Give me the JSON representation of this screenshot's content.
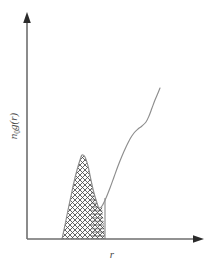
{
  "figure": {
    "kind": "scientific-line-plot",
    "background_color": "#ffffff",
    "axis_color": "#6e6e6e",
    "curve_color": "#8d8d8d",
    "hatch_color": "#4a4a4a",
    "label_color": "#4a4a4a"
  },
  "labels": {
    "y_axis_main": "n",
    "y_axis_subscript": "0",
    "y_axis_tail": "g(r)",
    "y_axis_full": "n0g(r)",
    "x_axis": "r"
  },
  "chart_data": {
    "type": "line",
    "title": "",
    "xlabel": "r",
    "ylabel": "n0g(r)",
    "grid": false,
    "legend": null,
    "ticks": {
      "x": [],
      "y": [],
      "note": "no numeric tick labels or tick marks are drawn on either axis"
    },
    "axes": {
      "x_arrow": true,
      "y_arrow": true,
      "origin_px": [
        27,
        239
      ],
      "x_tip_px": [
        203,
        239
      ],
      "y_tip_px": [
        27,
        14
      ]
    },
    "annotations": [
      {
        "name": "cross-hatched-peak",
        "pattern": "cross-hatch",
        "description": "first coordination shell peak filled with diagonal cross-hatching"
      },
      {
        "name": "horizontal-hatched-region",
        "pattern": "horizontal-lines",
        "description": "lower right sub-region under the peak tail filled with horizontal lines, bounded by a vertical edge"
      }
    ],
    "series": [
      {
        "name": "n0g(r)",
        "description": "sharp asymmetric first peak falling to a minimum, then an S-shaped rise",
        "points_px": [
          [
            62,
            239
          ],
          [
            65,
            225
          ],
          [
            68,
            210
          ],
          [
            71,
            196
          ],
          [
            74,
            182
          ],
          [
            77,
            170
          ],
          [
            80,
            160
          ],
          [
            82,
            155
          ],
          [
            85,
            157
          ],
          [
            88,
            166
          ],
          [
            91,
            180
          ],
          [
            94,
            193
          ],
          [
            97,
            203
          ],
          [
            99,
            208
          ],
          [
            102,
            206
          ],
          [
            106,
            198
          ],
          [
            110,
            188
          ],
          [
            114,
            177
          ],
          [
            118,
            166
          ],
          [
            122,
            156
          ],
          [
            126,
            147
          ],
          [
            130,
            139
          ],
          [
            134,
            133
          ],
          [
            138,
            129
          ],
          [
            142,
            126
          ],
          [
            146,
            122
          ],
          [
            149,
            116
          ],
          [
            152,
            108
          ],
          [
            155,
            100
          ],
          [
            158,
            93
          ],
          [
            160,
            88
          ]
        ]
      }
    ],
    "features": {
      "peak_apex_px": [
        82,
        155
      ],
      "valley_min_px": [
        99,
        208
      ],
      "curve_end_px": [
        160,
        88
      ],
      "fill_left_base_px": 62,
      "fill_right_edge_px": 105
    }
  }
}
